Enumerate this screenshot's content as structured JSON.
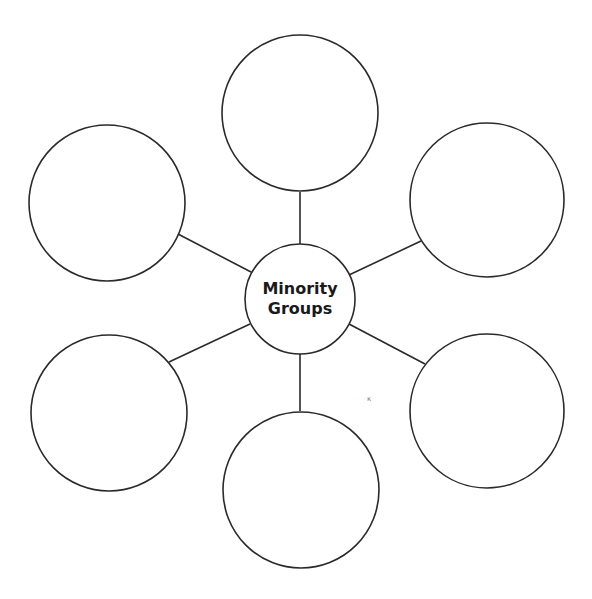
{
  "diagram": {
    "type": "web-organizer",
    "center": {
      "line1": "Minority",
      "line2": "Groups"
    },
    "outer_circle_count": 6,
    "outer_circles": [
      {
        "position": "top",
        "text": ""
      },
      {
        "position": "upper-left",
        "text": ""
      },
      {
        "position": "upper-right",
        "text": ""
      },
      {
        "position": "lower-left",
        "text": ""
      },
      {
        "position": "lower-right",
        "text": ""
      },
      {
        "position": "bottom",
        "text": ""
      }
    ],
    "stray_mark": "κ",
    "colors": {
      "stroke": "#2a2a2a",
      "background": "#ffffff"
    }
  }
}
